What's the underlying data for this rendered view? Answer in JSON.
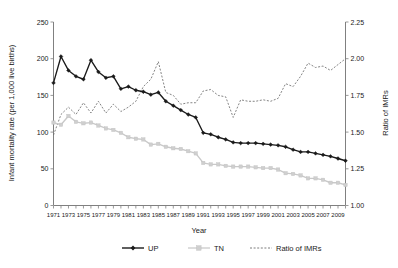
{
  "chart_data": {
    "type": "line",
    "title": "",
    "xlabel": "Year",
    "ylabel": "Infant mortality rate (per 1,000 live births)",
    "y2label": "Ratio of IMRs",
    "grid": false,
    "legend_position": "bottom",
    "xlim": [
      1971,
      2010
    ],
    "ylim": [
      0,
      250
    ],
    "y2lim": [
      1.0,
      2.25
    ],
    "yticks": [
      "0",
      "50",
      "100",
      "150",
      "200",
      "250"
    ],
    "ytick_values": [
      0,
      50,
      100,
      150,
      200,
      250
    ],
    "y2ticks": [
      "1.00",
      "1.25",
      "1.50",
      "1.75",
      "2.00",
      "2.25"
    ],
    "y2tick_values": [
      1.0,
      1.25,
      1.5,
      1.75,
      2.0,
      2.25
    ],
    "x": [
      1971,
      1972,
      1973,
      1974,
      1975,
      1976,
      1977,
      1978,
      1979,
      1980,
      1981,
      1982,
      1983,
      1984,
      1985,
      1986,
      1987,
      1988,
      1989,
      1990,
      1991,
      1992,
      1993,
      1994,
      1995,
      1996,
      1997,
      1998,
      1999,
      2000,
      2001,
      2002,
      2003,
      2004,
      2005,
      2006,
      2007,
      2008,
      2009,
      2010
    ],
    "xticklabels": [
      "1971",
      "",
      "1973",
      "",
      "1975",
      "",
      "1977",
      "",
      "1979",
      "",
      "1981",
      "",
      "1983",
      "",
      "1985",
      "",
      "1987",
      "",
      "1989",
      "",
      "1991",
      "",
      "1993",
      "",
      "1995",
      "",
      "1997",
      "",
      "1999",
      "",
      "2001",
      "",
      "2003",
      "",
      "2005",
      "",
      "2007",
      "",
      "2009",
      ""
    ],
    "series": [
      {
        "name": "UP",
        "axis": "left",
        "color": "#1a1a1a",
        "marker": "diamond",
        "style": "solid",
        "values": [
          167,
          203,
          184,
          176,
          172,
          198,
          182,
          174,
          176,
          159,
          162,
          157,
          155,
          151,
          154,
          142,
          136,
          130,
          124,
          120,
          99,
          97,
          93,
          90,
          86,
          85,
          85,
          85,
          84,
          83,
          82,
          80,
          76,
          73,
          73,
          71,
          69,
          67,
          64,
          61
        ]
      },
      {
        "name": "TN",
        "axis": "left",
        "color": "#cfcfcf",
        "marker": "square",
        "style": "solid",
        "values": [
          113,
          110,
          122,
          114,
          112,
          113,
          109,
          105,
          103,
          99,
          93,
          91,
          90,
          83,
          84,
          80,
          78,
          77,
          74,
          71,
          58,
          56,
          56,
          54,
          53,
          53,
          53,
          52,
          51,
          51,
          49,
          44,
          43,
          41,
          37,
          37,
          35,
          31,
          31,
          28
        ]
      },
      {
        "name": "Ratio of IMRs",
        "axis": "right",
        "color": "#6e6e6e",
        "marker": "none",
        "style": "dashed",
        "values": [
          1.48,
          1.62,
          1.67,
          1.62,
          1.7,
          1.63,
          1.71,
          1.63,
          1.69,
          1.64,
          1.67,
          1.71,
          1.81,
          1.86,
          1.98,
          1.77,
          1.75,
          1.69,
          1.7,
          1.7,
          1.78,
          1.79,
          1.75,
          1.74,
          1.6,
          1.72,
          1.71,
          1.71,
          1.72,
          1.71,
          1.73,
          1.83,
          1.81,
          1.88,
          1.97,
          1.94,
          1.95,
          1.92,
          1.96,
          2.0
        ]
      }
    ]
  },
  "legend": {
    "items": [
      {
        "label": "UP",
        "key": "up"
      },
      {
        "label": "TN",
        "key": "tn"
      },
      {
        "label": "Ratio of IMRs",
        "key": "ratio"
      }
    ]
  },
  "colors": {
    "up": "#1a1a1a",
    "tn": "#cfcfcf",
    "ratio": "#6e6e6e",
    "axis": "#808080",
    "background": "#ffffff"
  }
}
